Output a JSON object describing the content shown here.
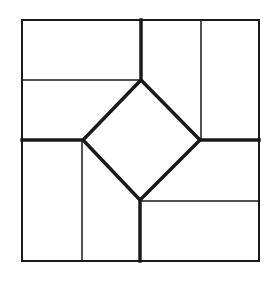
{
  "diagram": {
    "type": "geometric-tiling",
    "colors": {
      "background": "#ffffff",
      "stroke": "#1a1a1a"
    },
    "outer_square": {
      "x": 22,
      "y": 20,
      "width": 237,
      "height": 241
    },
    "thin_lines": [
      {
        "x1": 22,
        "y1": 80,
        "x2": 141,
        "y2": 80
      },
      {
        "x1": 201,
        "y1": 20,
        "x2": 201,
        "y2": 140
      },
      {
        "x1": 140,
        "y1": 201,
        "x2": 259,
        "y2": 201
      },
      {
        "x1": 82,
        "y1": 140,
        "x2": 82,
        "y2": 261
      }
    ],
    "thick_lines": [
      {
        "x1": 141,
        "y1": 20,
        "x2": 141,
        "y2": 80
      },
      {
        "x1": 200,
        "y1": 140,
        "x2": 259,
        "y2": 140
      },
      {
        "x1": 140,
        "y1": 200,
        "x2": 140,
        "y2": 261
      },
      {
        "x1": 22,
        "y1": 140,
        "x2": 83,
        "y2": 140
      }
    ],
    "diamond": {
      "points": "141,80 200,140 140,200 83,140"
    }
  }
}
